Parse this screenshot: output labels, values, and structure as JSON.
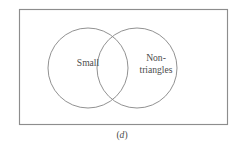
{
  "figure": {
    "caption_prefix": "(",
    "caption_letter": "d",
    "caption_suffix": ")",
    "caption_full": "(d)"
  },
  "diagram": {
    "type": "venn-two-set",
    "universe": {
      "name": "universal-set-rectangle",
      "x": 19,
      "y": 9,
      "width": 209,
      "height": 116,
      "stroke": "#8d8d8d"
    },
    "sets": [
      {
        "id": "left",
        "label": "Small",
        "label_lines": [
          "Small"
        ],
        "cx": 88,
        "cy": 68,
        "r": 40,
        "label_x": 88,
        "label_y": 64,
        "stroke": "#8b8b8b"
      },
      {
        "id": "right",
        "label": "Non-triangles",
        "label_lines": [
          "Non-",
          "triangles"
        ],
        "cx": 137,
        "cy": 68,
        "r": 40,
        "label_x": 156,
        "label_y": 59,
        "stroke": "#8b8b8b"
      }
    ],
    "colors": {
      "background": "#ffffff",
      "line": "#8b8b8b",
      "text": "#4c4c4c"
    }
  }
}
